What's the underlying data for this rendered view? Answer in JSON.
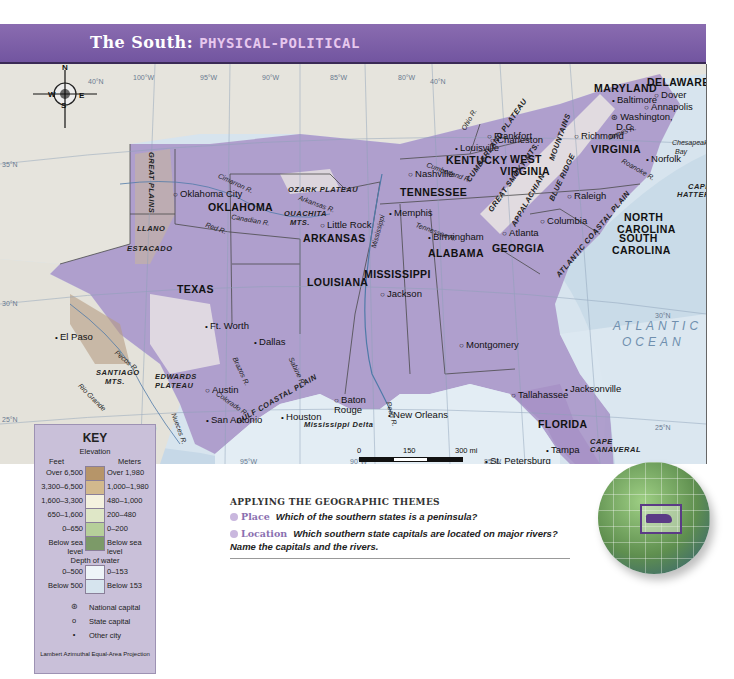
{
  "header": {
    "title_part1": "The South: ",
    "title_part2": "PHYSICAL-POLITICAL"
  },
  "colors": {
    "header": "#7a5ea6",
    "title_accent": "#e7c8ee",
    "ocean": "#d7e4ee",
    "deep_water": "#c6d8e7",
    "south_states": "#9a86bd",
    "other_land": "#e8e6e0",
    "key_bg": "#c9c0d9"
  },
  "compass": {
    "n": "N",
    "s": "S",
    "e": "E",
    "w": "W"
  },
  "degree_labels": [
    {
      "t": "40°N",
      "x": 88,
      "y": 14
    },
    {
      "t": "100°W",
      "x": 133,
      "y": 10
    },
    {
      "t": "95°W",
      "x": 200,
      "y": 10
    },
    {
      "t": "90°W",
      "x": 262,
      "y": 10
    },
    {
      "t": "85°W",
      "x": 330,
      "y": 10
    },
    {
      "t": "80°W",
      "x": 398,
      "y": 10
    },
    {
      "t": "40°N",
      "x": 430,
      "y": 14
    },
    {
      "t": "35°N",
      "x": 2,
      "y": 97
    },
    {
      "t": "30°N",
      "x": 2,
      "y": 236
    },
    {
      "t": "30°N",
      "x": 655,
      "y": 248
    },
    {
      "t": "25°N",
      "x": 2,
      "y": 352
    },
    {
      "t": "95°W",
      "x": 240,
      "y": 394
    },
    {
      "t": "90°W",
      "x": 350,
      "y": 394
    },
    {
      "t": "85°W",
      "x": 484,
      "y": 394
    },
    {
      "t": "25°N",
      "x": 655,
      "y": 360
    }
  ],
  "states": [
    {
      "t": "WEST",
      "x": 510,
      "y": 90
    },
    {
      "t": "VIRGINIA",
      "x": 500,
      "y": 102
    },
    {
      "t": "MARYLAND",
      "x": 594,
      "y": 19
    },
    {
      "t": "DELAWARE",
      "x": 647,
      "y": 13
    },
    {
      "t": "KENTUCKY",
      "x": 446,
      "y": 91
    },
    {
      "t": "VIRGINIA",
      "x": 591,
      "y": 80
    },
    {
      "t": "TENNESSEE",
      "x": 400,
      "y": 123
    },
    {
      "t": "NORTH",
      "x": 624,
      "y": 148
    },
    {
      "t": "CAROLINA",
      "x": 617,
      "y": 160
    },
    {
      "t": "OKLAHOMA",
      "x": 208,
      "y": 138
    },
    {
      "t": "ARKANSAS",
      "x": 303,
      "y": 169
    },
    {
      "t": "SOUTH",
      "x": 619,
      "y": 169
    },
    {
      "t": "CAROLINA",
      "x": 612,
      "y": 181
    },
    {
      "t": "GEORGIA",
      "x": 492,
      "y": 179
    },
    {
      "t": "ALABAMA",
      "x": 428,
      "y": 184
    },
    {
      "t": "MISSISSIPPI",
      "x": 364,
      "y": 205
    },
    {
      "t": "LOUISIANA",
      "x": 307,
      "y": 213
    },
    {
      "t": "TEXAS",
      "x": 177,
      "y": 220
    },
    {
      "t": "FLORIDA",
      "x": 538,
      "y": 355
    }
  ],
  "cities": [
    {
      "t": "Baltimore",
      "x": 612,
      "y": 31,
      "sym": "dot"
    },
    {
      "t": "Dover",
      "x": 654,
      "y": 26,
      "sym": "ring"
    },
    {
      "t": "Annapolis",
      "x": 644,
      "y": 38,
      "sym": "ring"
    },
    {
      "t": "Washington,",
      "x": 611,
      "y": 48,
      "sym": "star"
    },
    {
      "t": "D.C.",
      "x": 616,
      "y": 58,
      "sym": ""
    },
    {
      "t": "Charleston",
      "x": 490,
      "y": 71,
      "sym": "ring"
    },
    {
      "t": "Frankfort",
      "x": 487,
      "y": 67,
      "sym": "ring"
    },
    {
      "t": "Louisville",
      "x": 455,
      "y": 79,
      "sym": "dot"
    },
    {
      "t": "Richmond",
      "x": 574,
      "y": 67,
      "sym": "ring"
    },
    {
      "t": "Norfolk",
      "x": 646,
      "y": 90,
      "sym": "dot"
    },
    {
      "t": "Nashville",
      "x": 408,
      "y": 105,
      "sym": "ring"
    },
    {
      "t": "Raleigh",
      "x": 567,
      "y": 127,
      "sym": "ring"
    },
    {
      "t": "Oklahoma City",
      "x": 173,
      "y": 125,
      "sym": "ring"
    },
    {
      "t": "Little Rock",
      "x": 320,
      "y": 156,
      "sym": "ring"
    },
    {
      "t": "Memphis",
      "x": 389,
      "y": 144,
      "sym": "dot"
    },
    {
      "t": "Birmingham",
      "x": 428,
      "y": 168,
      "sym": "dot"
    },
    {
      "t": "Atlanta",
      "x": 502,
      "y": 164,
      "sym": "ring"
    },
    {
      "t": "Columbia",
      "x": 540,
      "y": 152,
      "sym": "ring"
    },
    {
      "t": "Ft. Worth",
      "x": 205,
      "y": 257,
      "sym": "dot"
    },
    {
      "t": "Dallas",
      "x": 254,
      "y": 273,
      "sym": "dot"
    },
    {
      "t": "Jackson",
      "x": 380,
      "y": 225,
      "sym": "ring"
    },
    {
      "t": "Montgomery",
      "x": 459,
      "y": 276,
      "sym": "ring"
    },
    {
      "t": "El Paso",
      "x": 55,
      "y": 268,
      "sym": "dot"
    },
    {
      "t": "Austin",
      "x": 205,
      "y": 321,
      "sym": "ring"
    },
    {
      "t": "San Antonio",
      "x": 206,
      "y": 351,
      "sym": "dot"
    },
    {
      "t": "Houston",
      "x": 281,
      "y": 348,
      "sym": "dot"
    },
    {
      "t": "Baton",
      "x": 334,
      "y": 331,
      "sym": "ring"
    },
    {
      "t": "Rouge",
      "x": 334,
      "y": 341,
      "sym": "",
      "abs": true
    },
    {
      "t": "New Orleans",
      "x": 388,
      "y": 346,
      "sym": "dot",
      "abs": true
    },
    {
      "t": "Jacksonville",
      "x": 565,
      "y": 320,
      "sym": "dot",
      "abs": true
    },
    {
      "t": "Tallahassee",
      "x": 511,
      "y": 326,
      "sym": "ring",
      "abs": true
    },
    {
      "t": "Tampa",
      "x": 546,
      "y": 381,
      "sym": "dot",
      "abs": true
    },
    {
      "t": "St. Petersburg",
      "x": 485,
      "y": 392,
      "sym": "dot",
      "abs": true
    },
    {
      "t": "Miami",
      "x": 604,
      "y": 418,
      "sym": "dot",
      "abs": true
    }
  ],
  "physical": [
    {
      "t": "OZARK PLATEAU",
      "x": 288,
      "y": 122
    },
    {
      "t": "OUACHITA",
      "x": 284,
      "y": 146
    },
    {
      "t": "MTS.",
      "x": 290,
      "y": 155
    },
    {
      "t": "LLANO",
      "x": 137,
      "y": 161
    },
    {
      "t": "ESTACADO",
      "x": 127,
      "y": 181
    },
    {
      "t": "EDWARDS",
      "x": 155,
      "y": 309
    },
    {
      "t": "PLATEAU",
      "x": 155,
      "y": 318
    },
    {
      "t": "SANTIAGO",
      "x": 96,
      "y": 305
    },
    {
      "t": "MTS.",
      "x": 105,
      "y": 314
    },
    {
      "t": "CAPE",
      "x": 688,
      "y": 119
    },
    {
      "t": "HATTERAS",
      "x": 677,
      "y": 127
    },
    {
      "t": "CAPE",
      "x": 590,
      "y": 374
    },
    {
      "t": "CANAVERAL",
      "x": 590,
      "y": 382
    },
    {
      "t": "Lake",
      "x": 591,
      "y": 407
    },
    {
      "t": "Okeechobee",
      "x": 590,
      "y": 415
    },
    {
      "t": "CAPE",
      "x": 570,
      "y": 440
    },
    {
      "t": "SABLE",
      "x": 567,
      "y": 448
    },
    {
      "t": "Mississippi Delta",
      "x": 304,
      "y": 357
    }
  ],
  "rotated_physical": [
    {
      "t": "GREAT PLAINS",
      "x": 155,
      "y": 88,
      "r": 90
    },
    {
      "t": "CUMBERLAND PLATEAU",
      "x": 465,
      "y": 115,
      "r": -55
    },
    {
      "t": "GREAT SMOKY MTS.",
      "x": 487,
      "y": 145,
      "r": -55
    },
    {
      "t": "APPALACHIAN",
      "x": 510,
      "y": 160,
      "r": -60
    },
    {
      "t": "MOUNTAINS",
      "x": 548,
      "y": 95,
      "r": -70
    },
    {
      "t": "BLUE RIDGE",
      "x": 548,
      "y": 135,
      "r": -65
    },
    {
      "t": "ATLANTIC COASTAL PLAIN",
      "x": 555,
      "y": 210,
      "r": -50
    },
    {
      "t": "GULF COASTAL PLAIN",
      "x": 235,
      "y": 355,
      "r": -30
    }
  ],
  "rivers": [
    {
      "t": "Ohio R.",
      "x": 460,
      "y": 64,
      "r": -60
    },
    {
      "t": "Cimarron R.",
      "x": 220,
      "y": 108,
      "r": 25
    },
    {
      "t": "Arkansas R.",
      "x": 300,
      "y": 130,
      "r": 20
    },
    {
      "t": "Canadian R.",
      "x": 232,
      "y": 149,
      "r": 10
    },
    {
      "t": "Red R.",
      "x": 207,
      "y": 157,
      "r": 20
    },
    {
      "t": "Cumberland R.",
      "x": 428,
      "y": 97,
      "r": 20
    },
    {
      "t": "James R.",
      "x": 607,
      "y": 70,
      "r": -20
    },
    {
      "t": "Roanoke R.",
      "x": 624,
      "y": 93,
      "r": 30
    },
    {
      "t": "Tennessee R.",
      "x": 417,
      "y": 157,
      "r": 20
    },
    {
      "t": "Mississippi",
      "x": 370,
      "y": 183,
      "r": -75
    },
    {
      "t": "Pecos R.",
      "x": 118,
      "y": 285,
      "r": 40
    },
    {
      "t": "Brazos R.",
      "x": 238,
      "y": 292,
      "r": 65
    },
    {
      "t": "Sabine R.",
      "x": 294,
      "y": 292,
      "r": 65
    },
    {
      "t": "Colorado R.",
      "x": 219,
      "y": 326,
      "r": 35
    },
    {
      "t": "Nueces R.",
      "x": 177,
      "y": 348,
      "r": 70
    },
    {
      "t": "Rio Grande",
      "x": 82,
      "y": 318,
      "r": 45
    },
    {
      "t": "Pearl R.",
      "x": 392,
      "y": 337,
      "r": 75
    }
  ],
  "water_labels": [
    {
      "t": "ATLANTIC",
      "x": 613,
      "y": 256,
      "cls": "water"
    },
    {
      "t": "OCEAN",
      "x": 622,
      "y": 272,
      "cls": "water"
    },
    {
      "t": "Gulf   of   Mexico",
      "x": 300,
      "y": 433,
      "cls": "water"
    },
    {
      "t": "Chesapeake",
      "x": 672,
      "y": 75,
      "cls": "river"
    },
    {
      "t": "Bay",
      "x": 675,
      "y": 84,
      "cls": "river"
    },
    {
      "t": "Straits of Florida",
      "x": 625,
      "y": 434,
      "cls": "river"
    },
    {
      "t": "FLORIDA KEYS",
      "x": 586,
      "y": 455,
      "cls": "phys"
    }
  ],
  "countries": [
    {
      "t": "MEXICO",
      "x": 90,
      "y": 358
    }
  ],
  "scale_bar": {
    "mi_0": "0",
    "mi_150": "150",
    "mi_300": "300 mi",
    "km_0": "0",
    "km_150": "150",
    "km_300": "300 km"
  },
  "key": {
    "title": "KEY",
    "elevation_label": "Elevation",
    "feet_label": "Feet",
    "meters_label": "Meters",
    "elevation_rows": [
      {
        "feet": "Over 6,500",
        "meters": "Over 1,980",
        "color": "#b69569"
      },
      {
        "feet": "3,300–6,500",
        "meters": "1,000–1,980",
        "color": "#d2b98d"
      },
      {
        "feet": "1,600–3,300",
        "meters": "480–1,000",
        "color": "#f4f1df"
      },
      {
        "feet": "650–1,600",
        "meters": "200–480",
        "color": "#dfe7c7"
      },
      {
        "feet": "0–650",
        "meters": "0–200",
        "color": "#b6cf9a"
      },
      {
        "feet": "Below sea level",
        "meters": "Below sea level",
        "color": "#7c9a68"
      }
    ],
    "depth_label": "Depth of water",
    "depth_rows": [
      {
        "feet": "0–500",
        "meters": "0–153",
        "color": "#eef4f8"
      },
      {
        "feet": "Below 500",
        "meters": "Below 153",
        "color": "#d6e4ee"
      }
    ],
    "symbols": [
      {
        "glyph": "⊛",
        "label": "National capital"
      },
      {
        "glyph": "o",
        "label": "State capital"
      },
      {
        "glyph": "•",
        "label": "Other city"
      }
    ],
    "projection": "Lambert Azimuthal Equal-Area Projection"
  },
  "themes": {
    "heading": "APPLYING THE GEOGRAPHIC THEMES",
    "q1_kw": "Place",
    "q1": "Which of the southern states is a peninsula?",
    "q2_kw": "Location",
    "q2": "Which southern state capitals are located on major rivers? Name the capitals and the rivers."
  }
}
